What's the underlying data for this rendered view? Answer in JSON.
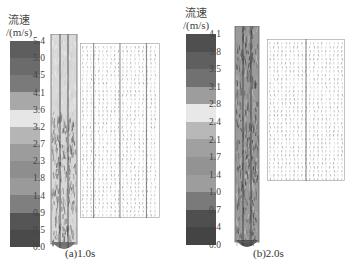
{
  "figure": {
    "panels": [
      {
        "id": "a",
        "caption": "(a)1.0s",
        "legend": {
          "title_line1": "流速",
          "title_line2": "/(m/s)",
          "ticks": [
            "5.4",
            "5.0",
            "4.5",
            "4.1",
            "3.6",
            "3.2",
            "2.7",
            "2.3",
            "1.8",
            "1.4",
            "0.9",
            "0.5",
            "0.0"
          ],
          "colors": [
            "#5e5e5e",
            "#6b6b6b",
            "#7a7a7a",
            "#a8a8a8",
            "#e6e6e6",
            "#b5b5b5",
            "#9c9c9c",
            "#8e8e8e",
            "#9a9a9a",
            "#7f7f7f",
            "#555555",
            "#4a4a4a"
          ]
        }
      },
      {
        "id": "b",
        "caption": "(b)2.0s",
        "legend": {
          "title_line1": "流速",
          "title_line2": "/(m/s)",
          "ticks": [
            "4.1",
            "3.8",
            "3.5",
            "3.1",
            "2.8",
            "2.4",
            "2.1",
            "1.7",
            "1.4",
            "1.0",
            "0.7",
            "0.4",
            "0.0"
          ],
          "colors": [
            "#4f4f4f",
            "#5f5f5f",
            "#717171",
            "#9d9d9d",
            "#e8e8e8",
            "#b8b8b8",
            "#a0a0a0",
            "#939393",
            "#9d9d9d",
            "#7a7a7a",
            "#4f4f4f",
            "#444444"
          ]
        }
      }
    ]
  }
}
